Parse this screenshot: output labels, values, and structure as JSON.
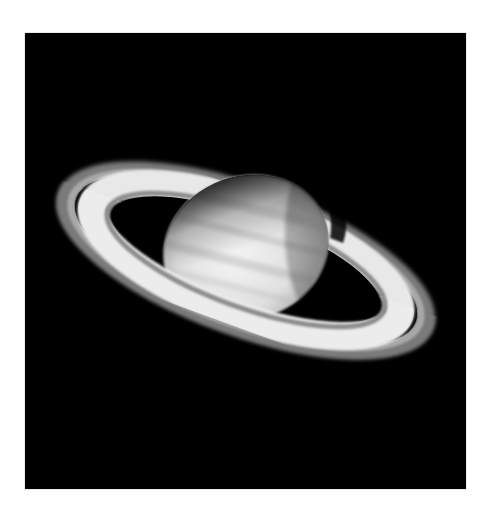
{
  "image": {
    "subject": "Saturn with rings",
    "background_color": "#ffffff",
    "frame_color": "#000000",
    "colors": {
      "planet_light": "#f2f2f2",
      "planet_mid": "#d4d4d4",
      "planet_shadow": "#6a6a6a",
      "band_dark": "#b8b8b8",
      "ring_bright": "#ececec",
      "ring_dim": "#9a9a9a",
      "cassini_gap": "#1a1a1a",
      "space": "#000000"
    }
  }
}
